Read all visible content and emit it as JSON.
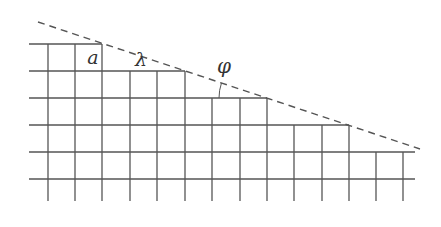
{
  "diagram": {
    "colors": {
      "grid": "#555555",
      "dashed_line": "#555555",
      "text": "#333333",
      "background": "#ffffff"
    },
    "labels": {
      "lattice_constant": "a",
      "step_length": "λ",
      "angle": "φ"
    },
    "grid": {
      "cell_size_px": 27.4,
      "left_x": 29,
      "right_x": 415,
      "bottom_y": 201,
      "rows": [
        {
          "y": 44,
          "x_end": 102
        },
        {
          "y": 71,
          "x_end": 185
        },
        {
          "y": 98,
          "x_end": 267
        },
        {
          "y": 125,
          "x_end": 349
        },
        {
          "y": 152,
          "x_end": 415
        },
        {
          "y": 179,
          "x_end": 415
        }
      ],
      "columns": [
        {
          "x": 48,
          "y_top": 44
        },
        {
          "x": 75,
          "y_top": 44
        },
        {
          "x": 102,
          "y_top": 44
        },
        {
          "x": 130,
          "y_top": 71
        },
        {
          "x": 157,
          "y_top": 71
        },
        {
          "x": 185,
          "y_top": 71
        },
        {
          "x": 212,
          "y_top": 98
        },
        {
          "x": 240,
          "y_top": 98
        },
        {
          "x": 267,
          "y_top": 98
        },
        {
          "x": 294,
          "y_top": 125
        },
        {
          "x": 322,
          "y_top": 125
        },
        {
          "x": 349,
          "y_top": 125
        },
        {
          "x": 376,
          "y_top": 152
        },
        {
          "x": 403,
          "y_top": 152
        }
      ]
    },
    "dashed_line": {
      "x1": 38,
      "y1": 22,
      "x2": 420,
      "y2": 149
    },
    "angle_arc": {
      "center_x": 267,
      "center_y": 98,
      "radius": 48
    }
  }
}
